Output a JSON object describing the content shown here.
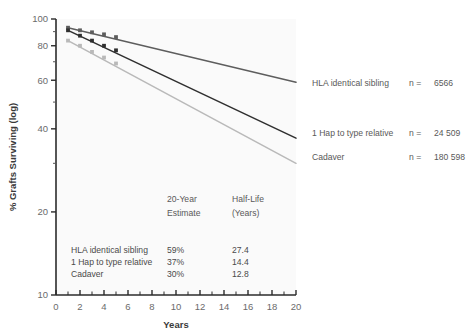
{
  "chart_data": {
    "type": "line",
    "title": "",
    "xlabel": "Years",
    "ylabel": "% Grafts Surviving (log)",
    "yscale": "log",
    "xlim": [
      0,
      20
    ],
    "ylim": [
      10,
      100
    ],
    "grid": false,
    "legend_position": "right",
    "x_ticks_major": [
      0,
      2,
      4,
      6,
      8,
      10,
      12,
      14,
      16,
      18,
      20
    ],
    "x_ticks_minor_step": 1,
    "y_ticks": [
      10,
      20,
      40,
      60,
      80,
      100
    ],
    "y_tick_labels": [
      "10",
      "20",
      "40",
      "60",
      "80",
      "100"
    ],
    "series": [
      {
        "name": "HLA identical sibling",
        "color": "#5d5d5d",
        "n": "6566",
        "n_label": "n =",
        "marker_x": [
          1,
          2,
          3,
          4,
          5
        ],
        "marker_y": [
          93,
          91,
          89.5,
          88,
          86
        ],
        "x": [
          1,
          20
        ],
        "y": [
          93,
          59
        ]
      },
      {
        "name": "1 Hap to type relative",
        "color": "#2f2f2f",
        "n": "24 509",
        "n_label": "n =",
        "marker_x": [
          1,
          2,
          3,
          4,
          5
        ],
        "marker_y": [
          91,
          87,
          83.5,
          80,
          77
        ],
        "x": [
          1,
          20
        ],
        "y": [
          91,
          37
        ]
      },
      {
        "name": "Cadaver",
        "color": "#b9b9b9",
        "n": "180 598",
        "n_label": "n =",
        "marker_x": [
          1,
          2,
          3,
          4,
          5
        ],
        "marker_y": [
          83.5,
          80,
          76,
          72.5,
          69
        ],
        "x": [
          1,
          20
        ],
        "y": [
          83.5,
          30
        ]
      }
    ]
  },
  "legend": {
    "entries": [
      {
        "label": "HLA identical sibling",
        "n_label": "n =",
        "n_value": "6566"
      },
      {
        "label": "1 Hap to type relative",
        "n_label": "n =",
        "n_value": "24 509"
      },
      {
        "label": "Cadaver",
        "n_label": "n =",
        "n_value": "180 598"
      }
    ]
  },
  "stats_table": {
    "headers": [
      {
        "line1": "20-Year",
        "line2": "Estimate"
      },
      {
        "line1": "Half-Life",
        "line2": "(Years)"
      }
    ],
    "rows": [
      {
        "name": "HLA identical sibling",
        "estimate": "59%",
        "half_life": "27.4"
      },
      {
        "name": "1 Hap to type relative",
        "estimate": "37%",
        "half_life": "14.4"
      },
      {
        "name": "Cadaver",
        "estimate": "30%",
        "half_life": "12.8"
      }
    ]
  },
  "axes": {
    "x_title": "Years",
    "y_title": "% Grafts Surviving (log)",
    "x_labels": [
      "0",
      "2",
      "4",
      "6",
      "8",
      "10",
      "12",
      "14",
      "16",
      "18",
      "20"
    ],
    "y_labels": [
      "100",
      "80",
      "60",
      "40",
      "20",
      "10"
    ]
  }
}
